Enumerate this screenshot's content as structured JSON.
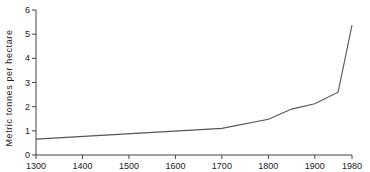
{
  "chart_data": {
    "type": "line",
    "title": "",
    "xlabel": "",
    "ylabel": "Metric tonnes per hectare",
    "x": [
      1300,
      1700,
      1800,
      1850,
      1900,
      1950,
      1980
    ],
    "series": [
      {
        "name": "Yield",
        "values": [
          0.66,
          1.1,
          1.48,
          1.9,
          2.12,
          2.6,
          5.37
        ]
      }
    ],
    "xlim": [
      1300,
      1980
    ],
    "ylim": [
      0,
      6
    ],
    "x_ticks": [
      1300,
      1400,
      1500,
      1600,
      1700,
      1800,
      1900,
      1980
    ],
    "y_ticks": [
      0,
      1,
      2,
      3,
      4,
      5,
      6
    ],
    "grid": false,
    "legend": "none",
    "line_color": "#555555"
  }
}
